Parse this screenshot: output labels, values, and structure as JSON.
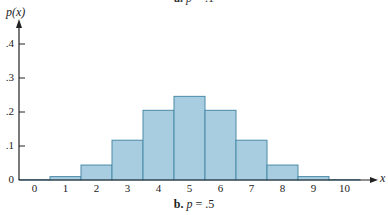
{
  "chart_data": {
    "type": "bar",
    "title": "b. p = .5",
    "top_caption": "a. p = .1",
    "xlabel": "x",
    "ylabel": "p(x)",
    "categories": [
      "0",
      "1",
      "2",
      "3",
      "4",
      "5",
      "6",
      "7",
      "8",
      "9",
      "10"
    ],
    "values": [
      0.001,
      0.01,
      0.044,
      0.117,
      0.205,
      0.246,
      0.205,
      0.117,
      0.044,
      0.01,
      0.001
    ],
    "yticks": [
      "0",
      ".1",
      ".2",
      ".3",
      ".4"
    ],
    "ylim": [
      0,
      0.45
    ],
    "grid": false,
    "bar_color": "#a9cde0",
    "bar_edge_color": "#4a8aa8"
  }
}
